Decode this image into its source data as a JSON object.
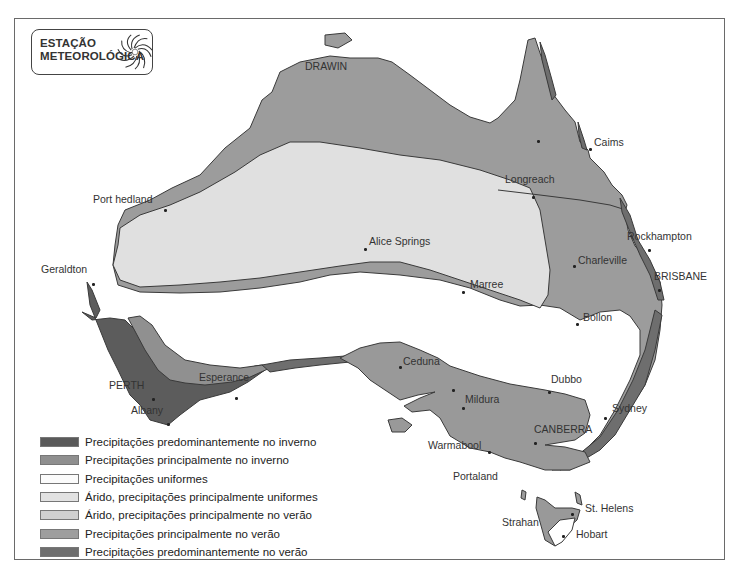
{
  "title": {
    "line1": "ESTAÇÃO",
    "line2": "METEOROLÓGICA",
    "logo_icon": "swirl-icon"
  },
  "colors": {
    "winter_dominant": "#5a5a5a",
    "winter_main": "#8f8f8f",
    "uniform": "#fbfbfb",
    "arid_uniform": "#e0e0e0",
    "arid_summer": "#d2d2d2",
    "summer_main": "#9e9e9e",
    "summer_dominant": "#6e6e6e",
    "outline": "#3a3a3a"
  },
  "legend": [
    {
      "label": "Precipitações predominantemente no inverno",
      "color": "#5a5a5a"
    },
    {
      "label": "Precipitações principalmente no inverno",
      "color": "#8f8f8f"
    },
    {
      "label": "Precipitações uniformes",
      "color": "#fbfbfb"
    },
    {
      "label": "Árido, precipitações principalmente uniformes",
      "color": "#e2e2e2"
    },
    {
      "label": "Árido, precipitações principalmente no verão",
      "color": "#d0d0d0"
    },
    {
      "label": "Precipitações principalmente no verão",
      "color": "#9e9e9e"
    },
    {
      "label": "Precipitações predominantemente no verão",
      "color": "#6e6e6e"
    }
  ],
  "cities": [
    {
      "name": "DRAWIN",
      "x": 305,
      "y": 67
    },
    {
      "name": "Caims",
      "x": 594,
      "y": 143
    },
    {
      "name": "Longreach",
      "x": 505,
      "y": 180
    },
    {
      "name": "Port hedland",
      "x": 93,
      "y": 200
    },
    {
      "name": "Alice Springs",
      "x": 369,
      "y": 242
    },
    {
      "name": "Rockhampton",
      "x": 627,
      "y": 237
    },
    {
      "name": "Charleville",
      "x": 578,
      "y": 261
    },
    {
      "name": "Geraldton",
      "x": 41,
      "y": 270
    },
    {
      "name": "BRISBANE",
      "x": 654,
      "y": 277
    },
    {
      "name": "Marree",
      "x": 470,
      "y": 285
    },
    {
      "name": "Bollon",
      "x": 583,
      "y": 318
    },
    {
      "name": "Ceduna",
      "x": 403,
      "y": 362
    },
    {
      "name": "PERTH",
      "x": 109,
      "y": 386
    },
    {
      "name": "Esperance",
      "x": 199,
      "y": 378
    },
    {
      "name": "Dubbo",
      "x": 551,
      "y": 380
    },
    {
      "name": "Mildura",
      "x": 465,
      "y": 400
    },
    {
      "name": "Albany",
      "x": 131,
      "y": 411
    },
    {
      "name": "Sydney",
      "x": 612,
      "y": 409
    },
    {
      "name": "CANBERRA",
      "x": 534,
      "y": 430
    },
    {
      "name": "Warmabool",
      "x": 428,
      "y": 446
    },
    {
      "name": "Portaland",
      "x": 453,
      "y": 477
    },
    {
      "name": "St. Helens",
      "x": 585,
      "y": 509
    },
    {
      "name": "Strahan",
      "x": 502,
      "y": 523
    },
    {
      "name": "Hobart",
      "x": 576,
      "y": 535
    }
  ],
  "dots": [
    [
      164,
      209
    ],
    [
      92,
      283
    ],
    [
      364,
      248
    ],
    [
      462,
      291
    ],
    [
      532,
      196
    ],
    [
      537,
      140
    ],
    [
      589,
      148
    ],
    [
      573,
      265
    ],
    [
      648,
      249
    ],
    [
      658,
      289
    ],
    [
      576,
      323
    ],
    [
      399,
      366
    ],
    [
      452,
      389
    ],
    [
      462,
      407
    ],
    [
      548,
      391
    ],
    [
      604,
      417
    ],
    [
      534,
      442
    ],
    [
      488,
      451
    ],
    [
      235,
      397
    ],
    [
      152,
      398
    ],
    [
      167,
      423
    ],
    [
      571,
      513
    ],
    [
      562,
      535
    ]
  ]
}
